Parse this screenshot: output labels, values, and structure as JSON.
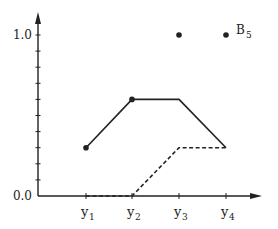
{
  "chart_data": {
    "type": "line",
    "title": "",
    "xlabel": "",
    "ylabel": "",
    "categories": [
      "y1",
      "y2",
      "y3",
      "y4"
    ],
    "x_tick_labels": [
      {
        "base": "y",
        "sub": "1"
      },
      {
        "base": "y",
        "sub": "2"
      },
      {
        "base": "y",
        "sub": "3"
      },
      {
        "base": "y",
        "sub": "4"
      }
    ],
    "y_tick_labels": [
      "0.0",
      "1.0"
    ],
    "ylim": [
      0.0,
      1.0
    ],
    "y_minor_ticks": 10,
    "grid": false,
    "series": [
      {
        "name": "solid",
        "style": "solid",
        "values": [
          0.3,
          0.6,
          0.6,
          0.3
        ],
        "markers": [
          true,
          true,
          false,
          false
        ]
      },
      {
        "name": "dashed",
        "style": "dashed",
        "values": [
          0.0,
          0.0,
          0.3,
          0.3
        ],
        "markers": [
          false,
          false,
          false,
          false
        ]
      },
      {
        "name": "B5",
        "style": "points",
        "values": [
          null,
          null,
          1.0,
          1.0
        ],
        "markers": [
          false,
          false,
          true,
          true
        ]
      }
    ],
    "annotations": [
      {
        "text_base": "B",
        "text_sub": "5",
        "at": "y4",
        "value": 1.0
      }
    ],
    "color": "#222222"
  }
}
